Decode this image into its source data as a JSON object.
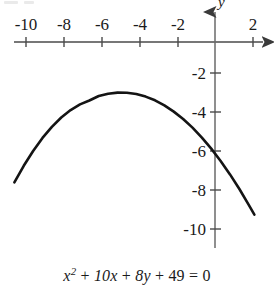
{
  "figure": {
    "title": "",
    "caption_equation": "x2 + 10x + 8y + 49 = 0",
    "axis_x_name": "x",
    "axis_y_name": "y"
  },
  "equation_parts": {
    "x": "x",
    "exp2": "2",
    "plus1": "+",
    "ten_x": "10x",
    "plus2": "+",
    "eight_y": "8y",
    "plus3": "+",
    "fortynine": "49",
    "equals": "=",
    "zero": "0"
  },
  "chart_data": {
    "type": "line",
    "title": "",
    "subtitle": "",
    "xlabel": "x",
    "ylabel": "y",
    "equation": "x^2 + 10x + 8y + 49 = 0",
    "solved_form": "y = -(x + 5)^2 / 8 - 3",
    "vertex": [
      -5,
      -3
    ],
    "opens": "down",
    "xlim": [
      -11.6,
      3
    ],
    "ylim": [
      -11.5,
      1.2
    ],
    "grid": false,
    "legend": null,
    "x_tick_labels": [
      "-10",
      "-8",
      "-6",
      "-4",
      "-2",
      "2"
    ],
    "x_tick_values": [
      -10,
      -8,
      -6,
      -4,
      -2,
      2
    ],
    "y_tick_labels": [
      "-2",
      "-4",
      "-6",
      "-8",
      "-10"
    ],
    "y_tick_values": [
      -2,
      -4,
      -6,
      -8,
      -10
    ],
    "x": [
      -10.7,
      -10.2,
      -9.7,
      -9.2,
      -8.7,
      -8.2,
      -7.7,
      -7.2,
      -6.7,
      -6.2,
      -5.7,
      -5.2,
      -4.7,
      -4.2,
      -3.7,
      -3.2,
      -2.7,
      -2.2,
      -1.7,
      -1.2,
      -0.7,
      -0.2,
      0.3,
      0.8,
      1.3,
      1.8,
      2.1
    ],
    "y": [
      -7.61,
      -6.76,
      -6.0,
      -5.33,
      -4.76,
      -4.28,
      -3.9,
      -3.61,
      -3.41,
      -3.18,
      -3.06,
      -3.005,
      -3.01,
      -3.08,
      -3.21,
      -3.4,
      -3.66,
      -3.98,
      -4.36,
      -4.8,
      -5.31,
      -5.88,
      -6.51,
      -7.2,
      -7.95,
      -8.76,
      -9.26
    ]
  },
  "style": {
    "curve_color": "#1a1a1a",
    "axis_color": "#5a5a5a",
    "text_color": "#1a1a1a",
    "background": "#ffffff"
  }
}
